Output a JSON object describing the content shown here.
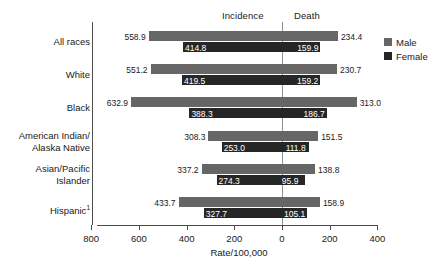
{
  "headers": {
    "incidence": "Incidence",
    "death": "Death"
  },
  "legend": {
    "male_label": "Male",
    "female_label": "Female",
    "male_color": "#666666",
    "female_color": "#262626"
  },
  "axis": {
    "x_title": "Rate/100,000",
    "tick_labels": [
      "800",
      "600",
      "400",
      "200",
      "0",
      "200",
      "400"
    ]
  },
  "footnote_marker": "1",
  "chart_data": {
    "type": "bar",
    "orientation": "horizontal-diverging",
    "title": "",
    "xlabel": "Rate/100,000",
    "ylabel": "",
    "grid": false,
    "legend_position": "right",
    "panels": [
      "Incidence",
      "Death"
    ],
    "axis_ticks_left_to_right": [
      800,
      600,
      400,
      200,
      0,
      200,
      400
    ],
    "categories": [
      "All races",
      "White",
      "Black",
      "American Indian/\nAlaska Native",
      "Asian/Pacific\nIslander",
      "Hispanic"
    ],
    "series": [
      {
        "name": "Male",
        "incidence": [
          558.9,
          551.2,
          632.9,
          308.3,
          337.2,
          433.7
        ],
        "death": [
          234.4,
          230.7,
          313.0,
          151.5,
          138.8,
          158.9
        ]
      },
      {
        "name": "Female",
        "incidence": [
          414.8,
          419.5,
          388.3,
          253.0,
          274.3,
          327.7
        ],
        "death": [
          159.9,
          159.2,
          186.7,
          111.8,
          95.9,
          105.1
        ]
      }
    ],
    "labels": {
      "all_races": {
        "male_incidence": "558.9",
        "male_death": "234.4",
        "female_incidence": "414.8",
        "female_death": "159.9"
      },
      "white": {
        "male_incidence": "551.2",
        "male_death": "230.7",
        "female_incidence": "419.5",
        "female_death": "159.2"
      },
      "black": {
        "male_incidence": "632.9",
        "male_death": "313.0",
        "female_incidence": "388.3",
        "female_death": "186.7"
      },
      "american_indian_alaska_native": {
        "male_incidence": "308.3",
        "male_death": "151.5",
        "female_incidence": "253.0",
        "female_death": "111.8"
      },
      "asian_pacific_islander": {
        "male_incidence": "337.2",
        "male_death": "138.8",
        "female_incidence": "274.3",
        "female_death": "95.9"
      },
      "hispanic": {
        "male_incidence": "433.7",
        "male_death": "158.9",
        "female_incidence": "327.7",
        "female_death": "105.1"
      }
    }
  }
}
